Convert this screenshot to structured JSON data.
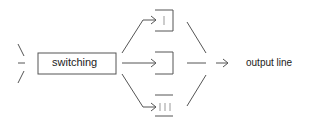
{
  "diagram": {
    "switch_label": "switching",
    "output_label": "output line",
    "channels": [
      {
        "id": "channel-1",
        "marker": "I"
      },
      {
        "id": "channel-2",
        "marker": ""
      },
      {
        "id": "channel-3",
        "marker": "III"
      }
    ],
    "colors": {
      "stroke": "#444444",
      "text": "#222222"
    }
  }
}
